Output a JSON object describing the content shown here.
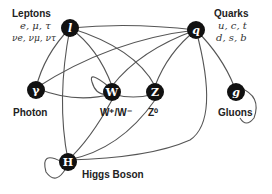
{
  "diagram": {
    "groups": {
      "leptons": {
        "label": "Leptons",
        "line1": "e, μ, τ",
        "line2": "νe, νμ, ντ"
      },
      "quarks": {
        "label": "Quarks",
        "line1": "u, c, t",
        "line2": "d, s, b"
      }
    },
    "nodes": [
      {
        "id": "l",
        "symbol": "l",
        "label": ""
      },
      {
        "id": "q",
        "symbol": "q",
        "label": ""
      },
      {
        "id": "gamma",
        "symbol": "γ",
        "label": "Photon"
      },
      {
        "id": "W",
        "symbol": "W",
        "label": "W⁺/W⁻"
      },
      {
        "id": "Z",
        "symbol": "Z",
        "label": "Z⁰"
      },
      {
        "id": "g",
        "symbol": "g",
        "label": "Gluons"
      },
      {
        "id": "H",
        "symbol": "H",
        "label": "Higgs Boson"
      }
    ],
    "edges": [
      [
        "l",
        "gamma"
      ],
      [
        "l",
        "W"
      ],
      [
        "l",
        "Z"
      ],
      [
        "l",
        "H"
      ],
      [
        "l",
        "q"
      ],
      [
        "q",
        "gamma"
      ],
      [
        "q",
        "W"
      ],
      [
        "q",
        "Z"
      ],
      [
        "q",
        "g"
      ],
      [
        "q",
        "H"
      ],
      [
        "gamma",
        "W"
      ],
      [
        "W",
        "Z"
      ],
      [
        "W",
        "W"
      ],
      [
        "W",
        "H"
      ],
      [
        "Z",
        "H"
      ],
      [
        "g",
        "g"
      ],
      [
        "H",
        "H"
      ]
    ]
  }
}
